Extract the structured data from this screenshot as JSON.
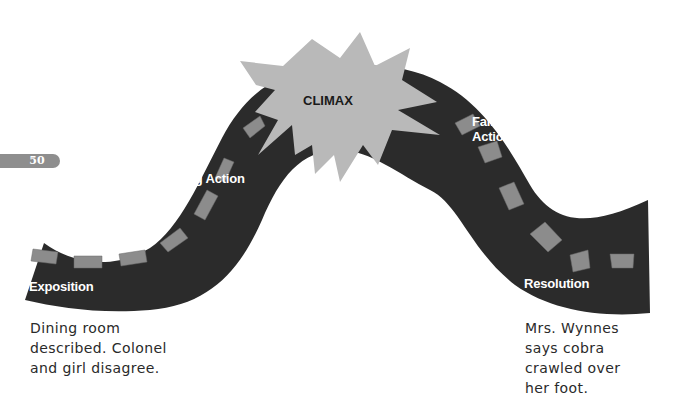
{
  "diagram": {
    "type": "plot-diagram",
    "page_number": "50",
    "colors": {
      "road": "#2b2b2b",
      "dash": "#8c8c8c",
      "starburst": "#b9b9b9",
      "label_text": "#ffffff",
      "climax_text": "#1a1a1a",
      "handwriting": "#2a2a2a",
      "badge": "#8e8e8e"
    },
    "stages": [
      {
        "id": "exposition",
        "label": "Exposition"
      },
      {
        "id": "rising-action",
        "label": "Rising Action"
      },
      {
        "id": "climax",
        "label": "CLIMAX"
      },
      {
        "id": "falling-action",
        "label_line1": "Falling",
        "label_line2": "Action"
      },
      {
        "id": "resolution",
        "label": "Resolution"
      }
    ],
    "notes": {
      "exposition": {
        "lines": [
          "Dining room",
          "described. Colonel",
          "and girl disagree."
        ]
      },
      "resolution": {
        "lines": [
          "Mrs. Wynnes",
          "says cobra",
          "crawled over",
          "her foot."
        ]
      }
    }
  }
}
